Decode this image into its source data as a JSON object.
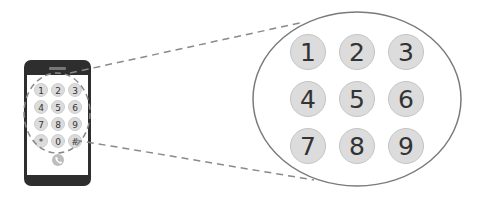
{
  "diagram": {
    "phone": {
      "keypad": [
        [
          "1",
          "2",
          "3"
        ],
        [
          "4",
          "5",
          "6"
        ],
        [
          "7",
          "8",
          "9"
        ],
        [
          "*",
          "0",
          "#"
        ]
      ],
      "call_icon": "phone-call-icon"
    },
    "magnified": {
      "keys": [
        "1",
        "2",
        "3",
        "4",
        "5",
        "6",
        "7",
        "8",
        "9"
      ]
    },
    "colors": {
      "phone_body": "#2e2e2e",
      "screen": "#ffffff",
      "key_fill": "#dcdcdc",
      "key_stroke": "#c4c4c4",
      "key_text": "#333333",
      "callout_line": "#8a8a8a",
      "ellipse_stroke": "#7a7a7a"
    }
  }
}
